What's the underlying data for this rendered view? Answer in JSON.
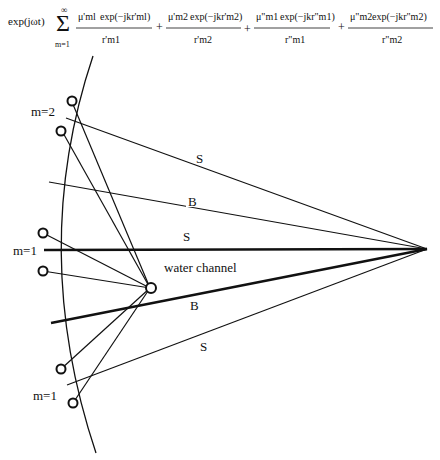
{
  "formula": {
    "prefix": "exp(jωt)",
    "sum_symbol": "Σ",
    "sum_upper": "∞",
    "sum_lower": "m=1",
    "terms": [
      {
        "num_coef": "μ'ml",
        "num_exp": "exp(−jkr'ml)",
        "den": "r'm1"
      },
      {
        "num_coef": "μ'm2",
        "num_exp": "exp(−jkr'm2)",
        "den": "r'm2"
      },
      {
        "num_coef": "μ\"m1",
        "num_exp": "exp(−jkr\"m1)",
        "den": "r\"m1"
      },
      {
        "num_coef": "μ\"m2",
        "num_exp": "exp(−jkr\"m2)",
        "den": "r\"m2"
      }
    ],
    "plus": "+"
  },
  "labels": {
    "m2": "m=2",
    "m1_upper": "m=1",
    "m1_lower": "m=1",
    "ray_s_top": "S",
    "ray_b_top": "B",
    "ray_s_mid": "S",
    "ray_b_bottom": "B",
    "ray_s_bottom": "S",
    "water_channel": "water channel"
  },
  "colors": {
    "line": "#111111",
    "background": "#ffffff"
  }
}
